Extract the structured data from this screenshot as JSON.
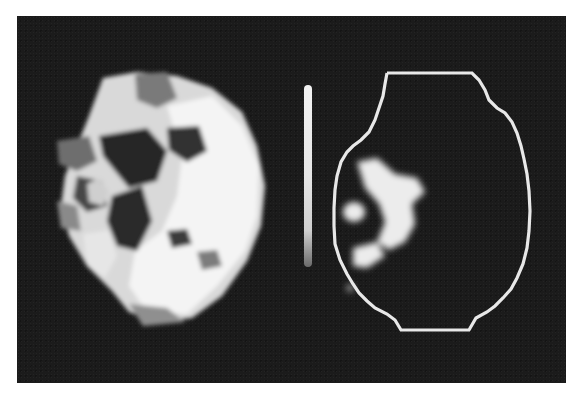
{
  "figure": {
    "background_color": "#1b1b1b",
    "page_color": "#ffffff",
    "panels": [
      {
        "id": "left",
        "content": "full-intensity pixelated uptake map of a roughly circular cross-section with bright white regions and darker gray holes"
      },
      {
        "id": "right",
        "content": "thresholded uptake map showing a small bright cluster inside a white polygonal outline contour"
      }
    ],
    "colorbar": {
      "orientation": "vertical",
      "top_color": "#f2f2f2",
      "bottom_color": "#6a6a6a"
    },
    "outline_color": "#e8e8e8"
  }
}
